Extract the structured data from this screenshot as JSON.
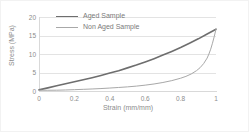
{
  "chart_data": {
    "type": "line",
    "title": "",
    "xlabel": "Strain (mm/mm)",
    "ylabel": "Stress (MPa)",
    "xlim": [
      0,
      1
    ],
    "ylim": [
      0,
      20
    ],
    "xticks": [
      "0",
      "0.2",
      "0.4",
      "0.6",
      "0.8",
      "1"
    ],
    "xtick_values": [
      0,
      0.2,
      0.4,
      0.6,
      0.8,
      1
    ],
    "yticks": [
      "0",
      "5",
      "10",
      "15",
      "20"
    ],
    "ytick_values": [
      0,
      5,
      10,
      15,
      20
    ],
    "grid": "horizontal",
    "legend_position": "top-left-inside",
    "series": [
      {
        "name": "Aged Sample",
        "color": "#6e6e6e",
        "width": 1.6,
        "note": "loading (upper) branch of hysteresis loop, rises from origin to peak",
        "points": [
          [
            0.0,
            0.3
          ],
          [
            0.05,
            0.85
          ],
          [
            0.1,
            1.4
          ],
          [
            0.15,
            1.95
          ],
          [
            0.2,
            2.5
          ],
          [
            0.25,
            3.05
          ],
          [
            0.3,
            3.6
          ],
          [
            0.35,
            4.2
          ],
          [
            0.4,
            4.85
          ],
          [
            0.45,
            5.5
          ],
          [
            0.5,
            6.25
          ],
          [
            0.55,
            7.0
          ],
          [
            0.6,
            7.85
          ],
          [
            0.65,
            8.75
          ],
          [
            0.7,
            9.7
          ],
          [
            0.75,
            10.7
          ],
          [
            0.8,
            11.75
          ],
          [
            0.85,
            12.9
          ],
          [
            0.9,
            14.1
          ],
          [
            0.95,
            15.4
          ],
          [
            1.0,
            16.7
          ]
        ]
      },
      {
        "name": "Non Aged Sample",
        "color": "#a8a8a8",
        "width": 1.0,
        "note": "unloading (lower) branch of hysteresis loop, flat then steep rise to peak",
        "points": [
          [
            0.0,
            0.2
          ],
          [
            0.05,
            0.2
          ],
          [
            0.1,
            0.22
          ],
          [
            0.15,
            0.28
          ],
          [
            0.2,
            0.36
          ],
          [
            0.25,
            0.45
          ],
          [
            0.3,
            0.55
          ],
          [
            0.35,
            0.66
          ],
          [
            0.4,
            0.8
          ],
          [
            0.45,
            0.95
          ],
          [
            0.5,
            1.12
          ],
          [
            0.55,
            1.32
          ],
          [
            0.6,
            1.58
          ],
          [
            0.65,
            1.9
          ],
          [
            0.7,
            2.3
          ],
          [
            0.75,
            2.8
          ],
          [
            0.8,
            3.45
          ],
          [
            0.83,
            3.95
          ],
          [
            0.86,
            4.6
          ],
          [
            0.89,
            5.5
          ],
          [
            0.91,
            6.3
          ],
          [
            0.93,
            7.4
          ],
          [
            0.95,
            8.9
          ],
          [
            0.96,
            10.0
          ],
          [
            0.97,
            11.3
          ],
          [
            0.98,
            12.9
          ],
          [
            0.99,
            14.7
          ],
          [
            1.0,
            16.7
          ]
        ]
      }
    ]
  },
  "legend": {
    "items": [
      {
        "label": "Aged Sample"
      },
      {
        "label": "Non Aged Sample"
      }
    ]
  }
}
